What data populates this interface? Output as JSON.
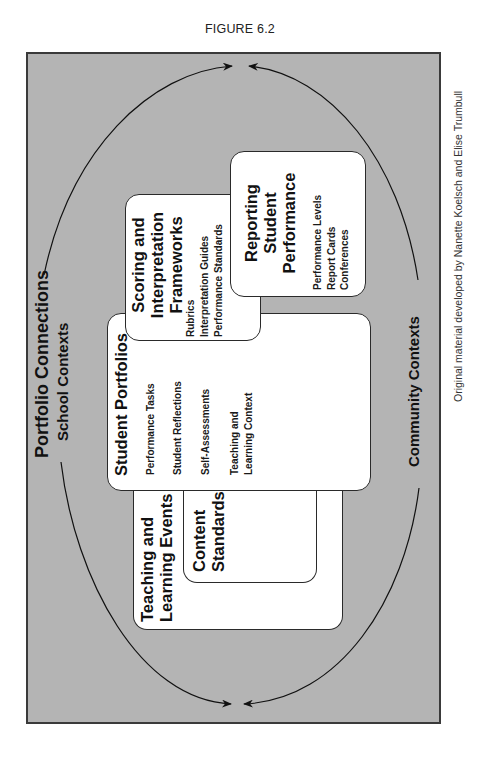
{
  "figure": {
    "label": "FIGURE 6.2",
    "credit": "Original material developed by Nanette Koelsch and Elise Trumbull"
  },
  "diagram": {
    "title": "Portfolio Connections",
    "outer_top_context": "School Contexts",
    "outer_bottom_context": "Community Contexts",
    "colors": {
      "background_fill": "#b4b4b4",
      "box_fill": "#ffffff",
      "stroke": "#2a2a2a"
    },
    "boxes": {
      "teaching_events": {
        "title_line1": "Teaching and",
        "title_line2": "Learning Events"
      },
      "content_standards": {
        "title_line1": "Content",
        "title_line2": "Standards"
      },
      "student_portfolios": {
        "title": "Student Portfolios",
        "items": [
          "Performance Tasks",
          "Student Reflections",
          "Self-Assessments",
          "Teaching and",
          "Learning Context"
        ]
      },
      "scoring": {
        "title_line1": "Scoring and",
        "title_line2": "Interpretation",
        "title_line3": "Frameworks",
        "items": [
          "Rubrics",
          "Interpretation Guides",
          "Performance Standards"
        ]
      },
      "reporting": {
        "title_line1": "Reporting",
        "title_line2": "Student",
        "title_line3": "Performance",
        "items": [
          "Performance Levels",
          "Report Cards",
          "Conferences"
        ]
      }
    }
  }
}
